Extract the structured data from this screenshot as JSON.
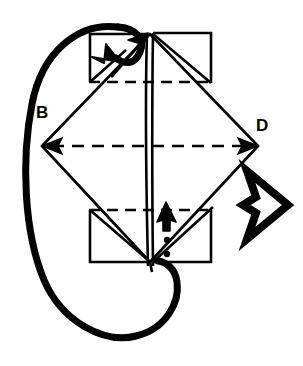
{
  "figure": {
    "type": "origami-fold-diagram",
    "title": "",
    "background_color": "#ffffff",
    "ink_color": "#000000",
    "width": 303,
    "height": 366
  },
  "labels": [
    {
      "id": "B",
      "text": "B",
      "x": 36,
      "y": 104,
      "role": "left-vertex-label"
    },
    {
      "id": "D",
      "text": "D",
      "x": 256,
      "y": 117,
      "role": "right-vertex-label"
    }
  ],
  "symbols": {
    "rotate_arrow": {
      "name": "rotation-loop-arrow",
      "description": "large bold elliptical loop with arrowhead at upper right indicating rotate model",
      "stroke_width": 7
    },
    "turn_over_arrow": {
      "name": "turn-over-arrow",
      "description": "outlined arrow pointing right with concave tail, meaning turn the model over",
      "x": 243,
      "y": 170,
      "width": 46,
      "height": 70
    },
    "valley_arrow_top": {
      "name": "fold-arrow-up-right",
      "description": "thin solid arrow pointing up and right in upper left panel"
    },
    "push_arrow_bottom": {
      "name": "push-in-arrow",
      "description": "solid filled arrowhead pointing up with trailing dotted line (push here)",
      "dots": 2
    }
  },
  "geometry": {
    "diamond": {
      "name": "central-diamond",
      "left": {
        "x": 42,
        "y": 146
      },
      "right": {
        "x": 258,
        "y": 146
      },
      "top": {
        "x": 150,
        "y": 34
      },
      "bottom": {
        "x": 150,
        "y": 262
      }
    },
    "dashed_lines": [
      {
        "name": "upper-crease",
        "y": 82,
        "x1": 88,
        "x2": 212
      },
      {
        "name": "center-crease",
        "y": 146,
        "x1": 42,
        "x2": 258,
        "arrowheads": "both"
      },
      {
        "name": "lower-crease",
        "y": 210,
        "x1": 88,
        "x2": 212
      }
    ],
    "rectangles": [
      {
        "name": "top-left-panel",
        "x": 90,
        "y": 32,
        "w": 58,
        "h": 50
      },
      {
        "name": "top-right-panel",
        "x": 152,
        "y": 32,
        "w": 58,
        "h": 50
      },
      {
        "name": "bottom-left-panel",
        "x": 90,
        "y": 210,
        "w": 58,
        "h": 52
      },
      {
        "name": "bottom-right-panel",
        "x": 152,
        "y": 210,
        "w": 58,
        "h": 52
      }
    ],
    "center_spine": {
      "name": "center-vertical-pair",
      "x_left": 146,
      "x_right": 153,
      "y_top": 32,
      "y_bottom": 266
    }
  }
}
